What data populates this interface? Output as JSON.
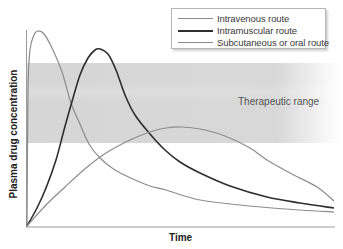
{
  "chart_data": {
    "type": "line",
    "title": "",
    "xlabel": "Time",
    "ylabel": "Plasma drug concentration",
    "grid": false,
    "legend_position": "top-right",
    "axis_ticks": "none",
    "band": {
      "label": "Therapeutic range",
      "y_top_px": 63,
      "y_bottom_px": 143,
      "color": "#d6d6d6"
    },
    "series": [
      {
        "name": "Intravenous route",
        "color": "#8c8c8c",
        "width": 1.2,
        "points": [
          [
            27,
            226
          ],
          [
            28,
            90
          ],
          [
            30,
            50
          ],
          [
            34,
            35
          ],
          [
            38,
            31
          ],
          [
            44,
            34
          ],
          [
            52,
            48
          ],
          [
            62,
            72
          ],
          [
            71,
            103
          ],
          [
            80,
            124
          ],
          [
            89,
            144
          ],
          [
            100,
            158
          ],
          [
            115,
            170
          ],
          [
            133,
            179
          ],
          [
            150,
            186
          ],
          [
            166,
            190
          ],
          [
            200,
            200
          ],
          [
            250,
            206
          ],
          [
            300,
            210
          ],
          [
            334,
            212
          ]
        ]
      },
      {
        "name": "Intramuscular route",
        "color": "#2e2e2e",
        "width": 1.6,
        "points": [
          [
            27,
            226
          ],
          [
            37,
            208
          ],
          [
            46,
            188
          ],
          [
            56,
            160
          ],
          [
            64,
            130
          ],
          [
            71,
            105
          ],
          [
            80,
            75
          ],
          [
            88,
            58
          ],
          [
            95,
            50
          ],
          [
            100,
            49
          ],
          [
            108,
            54
          ],
          [
            116,
            70
          ],
          [
            125,
            95
          ],
          [
            135,
            115
          ],
          [
            150,
            134
          ],
          [
            165,
            150
          ],
          [
            180,
            162
          ],
          [
            200,
            173
          ],
          [
            230,
            186
          ],
          [
            267,
            197
          ],
          [
            300,
            203
          ],
          [
            334,
            208
          ]
        ]
      },
      {
        "name": "Subcutaneous or oral route",
        "color": "#8c8c8c",
        "width": 1.2,
        "points": [
          [
            27,
            226
          ],
          [
            45,
            206
          ],
          [
            65,
            187
          ],
          [
            86,
            168
          ],
          [
            106,
            153
          ],
          [
            130,
            140
          ],
          [
            150,
            132
          ],
          [
            166,
            128
          ],
          [
            182,
            127
          ],
          [
            200,
            129
          ],
          [
            225,
            136
          ],
          [
            250,
            148
          ],
          [
            267,
            160
          ],
          [
            290,
            173
          ],
          [
            317,
            187
          ],
          [
            334,
            201
          ]
        ]
      }
    ]
  },
  "legend": {
    "items": [
      {
        "label": "Intravenous route"
      },
      {
        "label": "Intramuscular route"
      },
      {
        "label": "Subcutaneous or oral route"
      }
    ]
  },
  "labels": {
    "band": "Therapeutic range",
    "x": "Time",
    "y": "Plasma drug concentration"
  }
}
